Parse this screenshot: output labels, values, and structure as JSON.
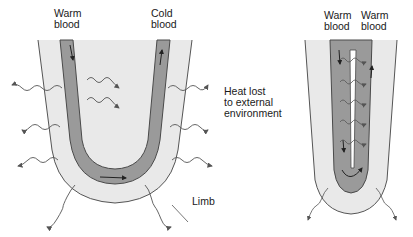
{
  "colors": {
    "limb_fill": "#e9e9e9",
    "limb_outline": "#555555",
    "vessel_fill": "#9a9a9a",
    "vessel_outline": "#4a4a4a",
    "arrow": "#555555",
    "text": "#1a1a1a"
  },
  "left_diagram": {
    "label_top_left": "Warm\nblood",
    "label_top_left_line1": "Warm",
    "label_top_left_line2": "blood",
    "label_top_right_line1": "Cold",
    "label_top_right_line2": "blood",
    "heat_label_line1": "Heat lost",
    "heat_label_line2": "to external",
    "heat_label_line3": "environment",
    "limb_label": "Limb"
  },
  "right_diagram": {
    "label_left_line1": "Warm",
    "label_left_line2": "blood",
    "label_right_line1": "Warm",
    "label_right_line2": "blood"
  }
}
